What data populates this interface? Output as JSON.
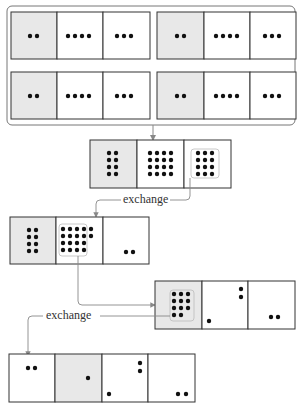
{
  "diagram": {
    "colors": {
      "border": "#333333",
      "shaded_cell": "#e8e8e8",
      "white_cell": "#ffffff",
      "dot": "#111111",
      "arrow": "#888888",
      "frame": "#777777"
    },
    "top_group": {
      "boxes": [
        {
          "cells": [
            {
              "dots": 2,
              "shaded": true
            },
            {
              "dots": 4,
              "shaded": false
            },
            {
              "dots": 3,
              "shaded": false
            }
          ]
        },
        {
          "cells": [
            {
              "dots": 2,
              "shaded": true
            },
            {
              "dots": 4,
              "shaded": false
            },
            {
              "dots": 3,
              "shaded": false
            }
          ]
        },
        {
          "cells": [
            {
              "dots": 2,
              "shaded": true
            },
            {
              "dots": 4,
              "shaded": false
            },
            {
              "dots": 3,
              "shaded": false
            }
          ]
        },
        {
          "cells": [
            {
              "dots": 2,
              "shaded": true
            },
            {
              "dots": 4,
              "shaded": false
            },
            {
              "dots": 3,
              "shaded": false
            }
          ]
        }
      ]
    },
    "step_2": {
      "cells": [
        {
          "dots": 8,
          "shaded": true
        },
        {
          "dots": 16,
          "shaded": false
        },
        {
          "dots": 12,
          "shaded": false
        }
      ]
    },
    "exchange_1_label": "exchange",
    "step_3": {
      "cells": [
        {
          "dots": 8,
          "shaded": true
        },
        {
          "dots": 18,
          "shaded": false
        },
        {
          "dots": 2,
          "shaded": false
        }
      ]
    },
    "step_4": {
      "cells": [
        {
          "dots": 11,
          "shaded": true
        },
        {
          "dots": 3,
          "shaded": false
        },
        {
          "dots": 2,
          "shaded": false
        }
      ]
    },
    "exchange_2_label": "exchange",
    "step_5": {
      "cells": [
        {
          "dots": 2,
          "shaded": false
        },
        {
          "dots": 1,
          "shaded": true
        },
        {
          "dots": 3,
          "shaded": false
        },
        {
          "dots": 2,
          "shaded": false
        }
      ]
    }
  }
}
